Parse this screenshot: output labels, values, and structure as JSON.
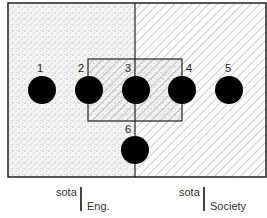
{
  "diagram": {
    "regions": [
      {
        "name": "sota-eng",
        "fill": "stipple",
        "color": "#d8d8d8"
      },
      {
        "name": "sota-society",
        "fill": "diagonal-hatch",
        "color": "#9a9a9a"
      },
      {
        "name": "overlap-box",
        "fill": "hatch-over-stipple"
      }
    ],
    "points": [
      {
        "label": "1",
        "x": 42,
        "y": 90
      },
      {
        "label": "2",
        "x": 89,
        "y": 90
      },
      {
        "label": "3",
        "x": 136,
        "y": 90
      },
      {
        "label": "4",
        "x": 182,
        "y": 90
      },
      {
        "label": "5",
        "x": 229,
        "y": 90
      },
      {
        "label": "6",
        "x": 135,
        "y": 150
      }
    ],
    "captions": [
      {
        "top": "sota",
        "bottom": "Eng."
      },
      {
        "top": "sota",
        "bottom": "Society"
      }
    ]
  }
}
